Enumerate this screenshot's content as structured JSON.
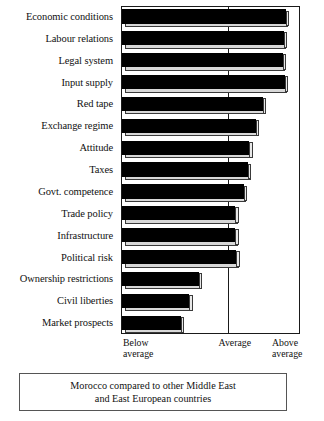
{
  "chart_data": {
    "type": "bar",
    "orientation": "horizontal",
    "title": "",
    "subtitle": "",
    "xlabel": "",
    "ylabel": "",
    "grid": false,
    "legend": "none",
    "categories": [
      "Economic conditions",
      "Labour relations",
      "Legal system",
      "Input supply",
      "Red tape",
      "Exchange regime",
      "Attitude",
      "Taxes",
      "Govt. competence",
      "Trade policy",
      "Infrastructure",
      "Political risk",
      "Ownership restrictions",
      "Civil liberties",
      "Market prospects"
    ],
    "values": [
      1.53,
      1.51,
      1.5,
      1.52,
      1.32,
      1.25,
      1.19,
      1.18,
      1.14,
      1.06,
      1.06,
      1.07,
      0.72,
      0.63,
      0.55
    ],
    "xlim": [
      0,
      1.67
    ],
    "x_tick_positions": [
      0,
      1.0,
      2.0
    ],
    "x_tick_labels": [
      "Below\naverage",
      "Average",
      "Above\naverage"
    ],
    "reference_line": {
      "value": 1.0,
      "label": "Average"
    },
    "scale_note": "0 = Below average, 1 = Average, 2 = Above average"
  },
  "axis": {
    "below_label": "Below\naverage",
    "average_label": "Average",
    "above_label": "Above\naverage"
  },
  "caption": {
    "text": "Morocco compared to other Middle East\nand East European countries"
  },
  "colors": {
    "bar_fill": "#000000",
    "bar_edge": "#3a3a3a",
    "bar_highlight": "#d8d8d8",
    "axis": "#1a1a1a",
    "text": "#111111",
    "background": "#ffffff"
  }
}
